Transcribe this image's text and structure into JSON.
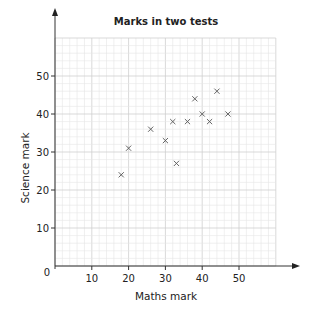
{
  "chart_data": {
    "type": "scatter",
    "title": "Marks in two tests",
    "xlabel": "Maths mark",
    "ylabel": "Science mark",
    "xlim": [
      0,
      60
    ],
    "ylim": [
      0,
      60
    ],
    "x_ticks": [
      10,
      20,
      30,
      40,
      50
    ],
    "y_ticks": [
      10,
      20,
      30,
      40,
      50
    ],
    "origin_label": "0",
    "grid": true,
    "grid_major_step": 10,
    "grid_minor_step": 2,
    "marker": "x",
    "points": [
      {
        "x": 18,
        "y": 24
      },
      {
        "x": 20,
        "y": 31
      },
      {
        "x": 26,
        "y": 36
      },
      {
        "x": 30,
        "y": 33
      },
      {
        "x": 32,
        "y": 38
      },
      {
        "x": 33,
        "y": 27
      },
      {
        "x": 36,
        "y": 38
      },
      {
        "x": 38,
        "y": 44
      },
      {
        "x": 40,
        "y": 40
      },
      {
        "x": 42,
        "y": 38
      },
      {
        "x": 44,
        "y": 46
      },
      {
        "x": 47,
        "y": 40
      }
    ]
  }
}
